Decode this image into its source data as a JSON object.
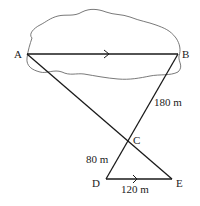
{
  "diagram": {
    "type": "geometry",
    "points": {
      "A": {
        "label": "A",
        "x": 27,
        "y": 54
      },
      "B": {
        "label": "B",
        "x": 178,
        "y": 54
      },
      "C": {
        "label": "C",
        "x": 128,
        "y": 141
      },
      "D": {
        "label": "D",
        "x": 106,
        "y": 179
      },
      "E": {
        "label": "E",
        "x": 172,
        "y": 179
      }
    },
    "segments": [
      {
        "from": "A",
        "to": "B",
        "parallel_mark": true
      },
      {
        "from": "A",
        "to": "E"
      },
      {
        "from": "B",
        "to": "D"
      },
      {
        "from": "D",
        "to": "E",
        "parallel_mark": true
      }
    ],
    "measurements": {
      "BC": "180 m",
      "CD": "80 m",
      "DE": "120 m"
    },
    "region": {
      "name": "lake",
      "shape": "irregular blob enclosing AB"
    }
  }
}
